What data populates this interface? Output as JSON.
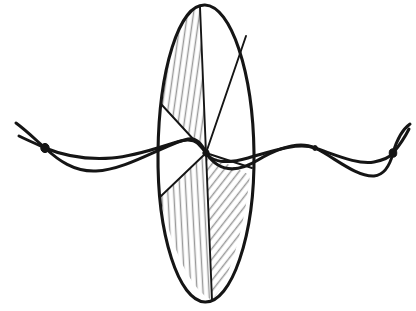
{
  "figure": {
    "title": "Standing wave on a string passing through a shaded elliptical disc",
    "background_color": "#ffffff",
    "ink_color": "#151515",
    "hatch_color": "#9a9a9a",
    "width": 416,
    "height": 311,
    "style": "hand-drawn line sketch"
  },
  "ellipse": {
    "name": "elliptical-disc",
    "center_x": 206,
    "center_y": 153,
    "radius_x": 48,
    "radius_y": 149,
    "top_y": 5,
    "bottom_y": 302,
    "left_x": 158,
    "right_x": 254,
    "outline_width": 3.1,
    "sector_count": 6,
    "shaded_sectors": [
      "upper-left",
      "lower-left",
      "lower-right"
    ],
    "unshaded_sectors": [
      "upper-right",
      "lower-center",
      "upper-center"
    ]
  },
  "sector_lines": [
    {
      "name": "spoke-to-top",
      "from_x": 206,
      "from_y": 153,
      "to_x": 200,
      "to_y": 7
    },
    {
      "name": "spoke-to-upper-left",
      "from_x": 206,
      "from_y": 153,
      "to_x": 161,
      "to_y": 104
    },
    {
      "name": "spoke-to-upper-right",
      "from_x": 206,
      "from_y": 153,
      "to_x": 246,
      "to_y": 36
    },
    {
      "name": "spoke-to-lower-left",
      "from_x": 206,
      "from_y": 153,
      "to_x": 160,
      "to_y": 197
    },
    {
      "name": "spoke-to-bottom",
      "from_x": 206,
      "from_y": 153,
      "to_x": 212,
      "to_y": 300
    },
    {
      "name": "spoke-to-lower-right",
      "from_x": 206,
      "from_y": 153,
      "to_x": 250,
      "to_y": 175
    }
  ],
  "wave": {
    "name": "standing-wave-string",
    "description": "two crossing string strands forming lobes between fixed nodes",
    "left_end_x": 16,
    "right_end_x": 410,
    "axis_y": 153,
    "strand_count": 2,
    "lobe_count": 3,
    "nodes": [
      {
        "name": "node-left-end",
        "x": 45,
        "y": 148
      },
      {
        "name": "node-center",
        "x": 206,
        "y": 153
      },
      {
        "name": "node-right-inner",
        "x": 315,
        "y": 148
      },
      {
        "name": "node-right-end",
        "x": 393,
        "y": 153
      }
    ]
  },
  "annotations": {
    "has_text_labels": false,
    "has_axes": false,
    "has_legend": false
  }
}
